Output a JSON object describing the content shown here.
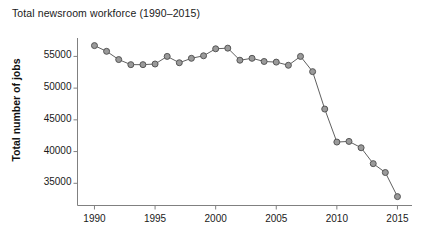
{
  "chart_data": {
    "type": "line",
    "title": "Total newsroom workforce (1990–2015)",
    "xlabel": "",
    "ylabel": "Total number of jobs",
    "xlim": [
      1988.6,
      2016.2
    ],
    "ylim": [
      31500,
      57900
    ],
    "xticks": [
      1990,
      1995,
      2000,
      2005,
      2010,
      2015
    ],
    "yticks": [
      35000,
      40000,
      45000,
      50000,
      55000
    ],
    "xtick_labels": [
      "1990",
      "1995",
      "2000",
      "2005",
      "2010",
      "2015"
    ],
    "ytick_labels": [
      "35000",
      "40000",
      "45000",
      "50000",
      "55000"
    ],
    "grid": false,
    "legend": null,
    "marker": "circle",
    "marker_face_color": "#9a9a9a",
    "marker_edge_color": "#555555",
    "line_color": "#606060",
    "axis_color": "#808080",
    "x": [
      1990,
      1991,
      1992,
      1993,
      1994,
      1995,
      1996,
      1997,
      1998,
      1999,
      2000,
      2001,
      2002,
      2003,
      2004,
      2005,
      2006,
      2007,
      2008,
      2009,
      2010,
      2011,
      2012,
      2013,
      2014,
      2015
    ],
    "values": [
      56700,
      55800,
      54500,
      53700,
      53700,
      53800,
      55000,
      54000,
      54700,
      55100,
      56200,
      56300,
      54400,
      54700,
      54200,
      54100,
      53600,
      55000,
      52600,
      46700,
      41500,
      41600,
      40600,
      38100,
      36700,
      32900
    ],
    "series": [
      {
        "name": "Total number of jobs",
        "values": [
          56700,
          55800,
          54500,
          53700,
          53700,
          53800,
          55000,
          54000,
          54700,
          55100,
          56200,
          56300,
          54400,
          54700,
          54200,
          54100,
          53600,
          55000,
          52600,
          46700,
          41500,
          41600,
          40600,
          38100,
          36700,
          32900
        ]
      }
    ]
  }
}
